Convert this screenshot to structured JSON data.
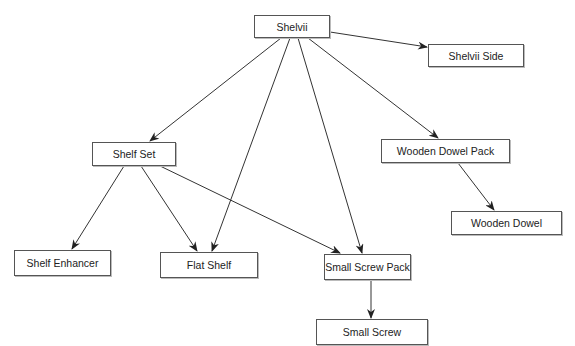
{
  "diagram": {
    "type": "tree",
    "colors": {
      "stroke": "#333333",
      "box_border": "#555555",
      "text": "#222222",
      "background": "#ffffff"
    },
    "nodes": [
      {
        "id": "shelvii",
        "label": "Shelvii",
        "x": 254,
        "y": 15,
        "w": 76,
        "h": 23
      },
      {
        "id": "shelvii-side",
        "label": "Shelvii Side",
        "x": 428,
        "y": 44,
        "w": 96,
        "h": 23
      },
      {
        "id": "shelf-set",
        "label": "Shelf Set",
        "x": 92,
        "y": 142,
        "w": 84,
        "h": 24
      },
      {
        "id": "wooden-dowel-pack",
        "label": "Wooden Dowel Pack",
        "x": 381,
        "y": 139,
        "w": 129,
        "h": 24
      },
      {
        "id": "wooden-dowel",
        "label": "Wooden Dowel",
        "x": 451,
        "y": 211,
        "w": 111,
        "h": 24
      },
      {
        "id": "shelf-enhancer",
        "label": "Shelf Enhancer",
        "x": 14,
        "y": 250,
        "w": 97,
        "h": 26
      },
      {
        "id": "flat-shelf",
        "label": "Flat Shelf",
        "x": 160,
        "y": 252,
        "w": 98,
        "h": 26
      },
      {
        "id": "small-screw-pack",
        "label": "Small Screw Pack",
        "x": 324,
        "y": 254,
        "w": 87,
        "h": 26
      },
      {
        "id": "small-screw",
        "label": "Small Screw",
        "x": 316,
        "y": 319,
        "w": 112,
        "h": 26
      }
    ],
    "edges": [
      {
        "from": "shelvii",
        "to": "shelvii-side",
        "x1": 330,
        "y1": 32,
        "x2": 427,
        "y2": 47
      },
      {
        "from": "shelvii",
        "to": "shelf-set",
        "x1": 281,
        "y1": 38,
        "x2": 150,
        "y2": 141
      },
      {
        "from": "shelvii",
        "to": "flat-shelf",
        "x1": 290,
        "y1": 38,
        "x2": 212,
        "y2": 251
      },
      {
        "from": "shelvii",
        "to": "small-screw-pack",
        "x1": 298,
        "y1": 38,
        "x2": 362,
        "y2": 253
      },
      {
        "from": "shelvii",
        "to": "wooden-dowel-pack",
        "x1": 308,
        "y1": 38,
        "x2": 438,
        "y2": 138
      },
      {
        "from": "shelf-set",
        "to": "shelf-enhancer",
        "x1": 124,
        "y1": 166,
        "x2": 72,
        "y2": 249
      },
      {
        "from": "shelf-set",
        "to": "flat-shelf",
        "x1": 141,
        "y1": 166,
        "x2": 197,
        "y2": 251
      },
      {
        "from": "shelf-set",
        "to": "small-screw-pack",
        "x1": 158,
        "y1": 165,
        "x2": 340,
        "y2": 253
      },
      {
        "from": "wooden-dowel-pack",
        "to": "wooden-dowel",
        "x1": 458,
        "y1": 163,
        "x2": 494,
        "y2": 210
      },
      {
        "from": "small-screw-pack",
        "to": "small-screw",
        "x1": 371,
        "y1": 280,
        "x2": 371,
        "y2": 318
      }
    ]
  }
}
